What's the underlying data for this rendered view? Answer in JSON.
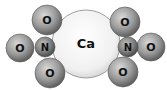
{
  "diagram": {
    "atoms": {
      "ca": {
        "label": "Ca"
      },
      "left_n": {
        "label": "N"
      },
      "right_n": {
        "label": "N"
      },
      "left_o_top": {
        "label": "O"
      },
      "left_o_left": {
        "label": "O"
      },
      "left_o_bottom": {
        "label": "O"
      },
      "right_o_top": {
        "label": "O"
      },
      "right_o_right": {
        "label": "O"
      },
      "right_o_bottom": {
        "label": "O"
      }
    }
  }
}
